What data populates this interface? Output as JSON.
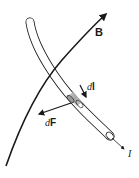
{
  "diagram": {
    "type": "physics-illustration",
    "title": "",
    "labels": {
      "field": "B",
      "element_prefix": "d",
      "element_symbol": "l",
      "force_prefix": "d",
      "force_symbol": "F",
      "current": "I"
    },
    "elements": [
      {
        "id": "field-line",
        "label": "B",
        "description": "curved magnetic field line with arrowhead"
      },
      {
        "id": "wire",
        "label": "I",
        "description": "curved conducting wire (tube) carrying current I"
      },
      {
        "id": "current-element",
        "label": "dl",
        "description": "shaded segment of wire with arrow"
      },
      {
        "id": "force-vector",
        "label": "dF",
        "description": "force arrow on element"
      }
    ],
    "colors": {
      "line": "#1a1a1a",
      "tube_fill": "#ffffff",
      "segment_fill": "#bdbdbd",
      "background": "#ffffff"
    }
  }
}
